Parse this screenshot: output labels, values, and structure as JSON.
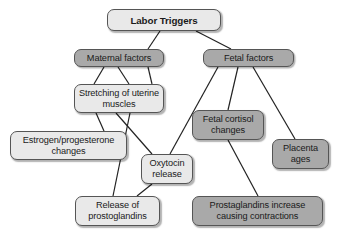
{
  "diagram": {
    "title": "Labor Triggers",
    "type": "flowchart",
    "colors": {
      "light_fill": "#e9e9e9",
      "dark_fill": "#a9a9a9",
      "border": "#555555",
      "text": "#1a1a1a",
      "background": "#ffffff"
    },
    "nodes": [
      {
        "id": "labor-triggers",
        "label": "Labor Triggers",
        "style": "light",
        "bold": true,
        "x": 107,
        "y": 9,
        "w": 114,
        "h": 22
      },
      {
        "id": "maternal-factors",
        "label": "Maternal factors",
        "style": "dark",
        "bold": false,
        "x": 74,
        "y": 49,
        "w": 90,
        "h": 18
      },
      {
        "id": "fetal-factors",
        "label": "Fetal factors",
        "style": "dark",
        "bold": false,
        "x": 203,
        "y": 49,
        "w": 91,
        "h": 18
      },
      {
        "id": "stretching-uterine-muscles",
        "label": "Stretching of uterine muscles",
        "style": "light",
        "bold": false,
        "x": 74,
        "y": 84,
        "w": 90,
        "h": 29
      },
      {
        "id": "estrogen-progesterone-changes",
        "label": "Estrogen/progesterone changes",
        "style": "light",
        "bold": false,
        "x": 10,
        "y": 131,
        "w": 117,
        "h": 29
      },
      {
        "id": "fetal-cortisol-changes",
        "label": "Fetal cortisol changes",
        "style": "dark",
        "bold": false,
        "x": 192,
        "y": 110,
        "w": 72,
        "h": 30
      },
      {
        "id": "placenta-ages",
        "label": "Placenta ages",
        "style": "dark",
        "bold": false,
        "x": 272,
        "y": 139,
        "w": 57,
        "h": 30
      },
      {
        "id": "oxytocin-release",
        "label": "Oxytocin release",
        "style": "light",
        "bold": false,
        "x": 141,
        "y": 154,
        "w": 52,
        "h": 30
      },
      {
        "id": "release-of-prostoglandins",
        "label": "Release of prostoglandins",
        "style": "light",
        "bold": false,
        "x": 75,
        "y": 196,
        "w": 85,
        "h": 30
      },
      {
        "id": "prostaglandins-increase",
        "label": "Prostaglandins increase causing contractions",
        "style": "dark",
        "bold": false,
        "x": 192,
        "y": 196,
        "w": 131,
        "h": 30
      }
    ],
    "edges": [
      {
        "id": "labor-to-maternal",
        "from": "labor-triggers",
        "to": "maternal-factors",
        "x1": 160,
        "y1": 31,
        "x2": 148,
        "y2": 49
      },
      {
        "id": "labor-to-fetal",
        "from": "labor-triggers",
        "to": "fetal-factors",
        "x1": 196,
        "y1": 31,
        "x2": 231,
        "y2": 49
      },
      {
        "id": "maternal-to-stretching-left",
        "from": "maternal-factors",
        "to": "stretching-uterine-muscles",
        "x1": 104,
        "y1": 67,
        "x2": 94,
        "y2": 84
      },
      {
        "id": "maternal-to-stretching-right",
        "from": "maternal-factors",
        "to": "stretching-uterine-muscles",
        "x1": 118,
        "y1": 67,
        "x2": 129,
        "y2": 84
      },
      {
        "id": "maternal-to-oxytocin",
        "from": "maternal-factors",
        "to": "oxytocin-release",
        "x1": 148,
        "y1": 67,
        "x2": 152,
        "y2": 84
      },
      {
        "id": "stretching-to-estrogen",
        "from": "stretching-uterine-muscles",
        "to": "estrogen-progesterone-changes",
        "x1": 96,
        "y1": 113,
        "x2": 104,
        "y2": 131
      },
      {
        "id": "stretching-to-prostoglandins",
        "from": "stretching-uterine-muscles",
        "to": "release-of-prostoglandins",
        "x1": 130,
        "y1": 113,
        "x2": 113,
        "y2": 196
      },
      {
        "id": "stretching-to-oxytocin",
        "from": "stretching-uterine-muscles",
        "to": "oxytocin-release",
        "x1": 116,
        "y1": 113,
        "x2": 152,
        "y2": 154
      },
      {
        "id": "oxytocin-to-prostoglandins",
        "from": "oxytocin-release",
        "to": "release-of-prostoglandins",
        "x1": 152,
        "y1": 184,
        "x2": 137,
        "y2": 196
      },
      {
        "id": "fetal-to-oxytocin",
        "from": "fetal-factors",
        "to": "oxytocin-release",
        "x1": 218,
        "y1": 67,
        "x2": 170,
        "y2": 154
      },
      {
        "id": "fetal-to-cortisol",
        "from": "fetal-factors",
        "to": "fetal-cortisol-changes",
        "x1": 238,
        "y1": 67,
        "x2": 228,
        "y2": 110
      },
      {
        "id": "fetal-to-placenta",
        "from": "fetal-factors",
        "to": "placenta-ages",
        "x1": 253,
        "y1": 67,
        "x2": 295,
        "y2": 139
      },
      {
        "id": "cortisol-to-prostaglandins",
        "from": "fetal-cortisol-changes",
        "to": "prostaglandins-increase",
        "x1": 228,
        "y1": 140,
        "x2": 258,
        "y2": 196
      }
    ]
  }
}
